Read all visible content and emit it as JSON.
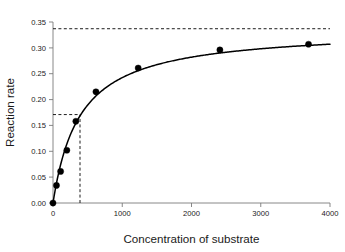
{
  "chart_data": {
    "type": "scatter",
    "title": "",
    "subtitle": "",
    "xlabel": "Concentration of substrate",
    "ylabel": "Reaction rate",
    "xlim": [
      0,
      4000
    ],
    "ylim": [
      0.0,
      0.35
    ],
    "xticks": [
      0,
      1000,
      2000,
      3000,
      4000
    ],
    "xtick_labels": [
      "0",
      "1000",
      "2000",
      "3000",
      "4000"
    ],
    "yticks": [
      0.0,
      0.05,
      0.1,
      0.15,
      0.2,
      0.25,
      0.3,
      0.35
    ],
    "ytick_labels": [
      "0.00",
      "0.05",
      "0.10",
      "0.15",
      "0.20",
      "0.25",
      "0.30",
      "0.35"
    ],
    "grid": false,
    "legend": false,
    "legend_position": "none",
    "series": [
      {
        "name": "Observed reaction rate",
        "marker": "filled-circle",
        "color": "#000000",
        "x": [
          0,
          50,
          110,
          200,
          330,
          620,
          1230,
          2410,
          3690
        ],
        "y": [
          0.0,
          0.034,
          0.061,
          0.102,
          0.158,
          0.215,
          0.261,
          0.296,
          0.307
        ]
      },
      {
        "name": "Michaelis-Menten fit",
        "marker": "none",
        "line": "solid",
        "color": "#000000",
        "model": "v = Vmax * S / (Km + S)",
        "vmax": 0.337,
        "km": 390
      }
    ],
    "annotations": [
      {
        "name": "vmax-asymptote",
        "style": "dashed-horizontal",
        "y": 0.337,
        "x_from": 0,
        "x_to": 4000,
        "label": ""
      },
      {
        "name": "half-vmax-line",
        "style": "dashed-horizontal",
        "y": 0.171,
        "x_from": 0,
        "x_to": 390,
        "label": ""
      },
      {
        "name": "km-line",
        "style": "dashed-vertical",
        "x": 390,
        "y_from": 0.0,
        "y_to": 0.171,
        "label": ""
      }
    ]
  },
  "colors": {
    "background": "#ffffff",
    "axis": "#7a7a7a",
    "curve": "#000000",
    "marker": "#000000",
    "dashed": "#111111",
    "text": "#1a1a1a"
  }
}
